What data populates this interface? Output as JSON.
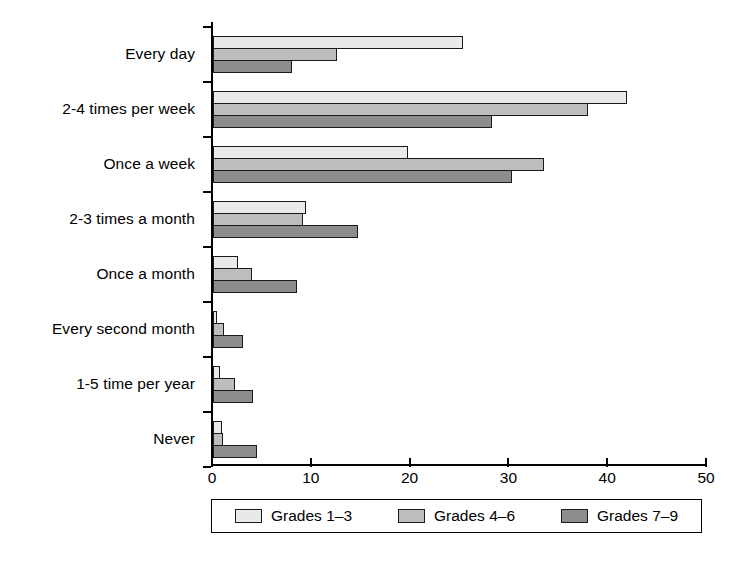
{
  "chart_data": {
    "type": "bar",
    "orientation": "horizontal",
    "title": "",
    "xlabel": "",
    "ylabel": "",
    "xlim": [
      0,
      50
    ],
    "xticks": [
      0,
      10,
      20,
      30,
      40,
      50
    ],
    "xtick_labels": [
      "0",
      "10",
      "20",
      "30",
      "40",
      "50"
    ],
    "grid": false,
    "legend_position": "bottom",
    "categories": [
      "Every day",
      "2-4 times per week",
      "Once a week",
      "2-3 times a month",
      "Once a month",
      "Every second month",
      "1-5 time per year",
      "Never"
    ],
    "series": [
      {
        "name": "Grades 1–3",
        "color": "#e9e9e9",
        "values": [
          25.3,
          41.9,
          19.7,
          9.4,
          2.5,
          0.4,
          0.7,
          0.9
        ]
      },
      {
        "name": "Grades 4–6",
        "color": "#bdbdbd",
        "values": [
          12.5,
          38.0,
          33.5,
          9.1,
          3.9,
          1.1,
          2.2,
          1.0
        ]
      },
      {
        "name": "Grades 7–9",
        "color": "#8d8d8d",
        "values": [
          8.0,
          28.2,
          30.3,
          14.7,
          8.5,
          3.0,
          4.0,
          4.5
        ]
      }
    ]
  },
  "legend": {
    "items": [
      {
        "label": "Grades 1–3",
        "swatch": "#e9e9e9"
      },
      {
        "label": "Grades 4–6",
        "swatch": "#bdbdbd"
      },
      {
        "label": "Grades 7–9",
        "swatch": "#8d8d8d"
      }
    ]
  },
  "axis": {
    "x_tick_labels": [
      "0",
      "10",
      "20",
      "30",
      "40",
      "50"
    ]
  }
}
